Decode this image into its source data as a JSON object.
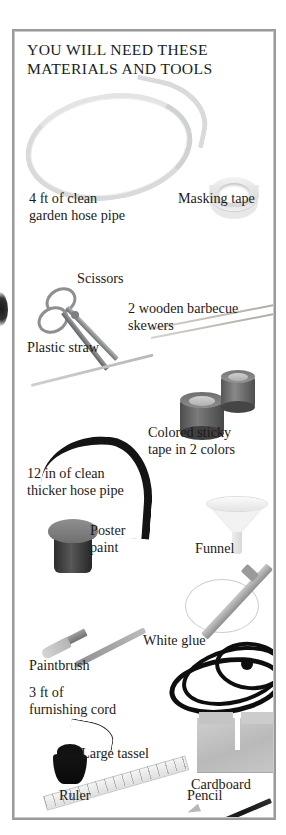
{
  "page": {
    "background_color": "#ffffff",
    "frame_border_color": "#9a9a9a"
  },
  "panel": {
    "title": "YOU WILL NEED THESE\nMATERIALS AND TOOLS"
  },
  "materials": [
    {
      "id": "garden-hose",
      "label": "4 ft of clean\ngarden hose pipe",
      "illustration": "coiled-light-gray-hose"
    },
    {
      "id": "masking-tape",
      "label": "Masking tape",
      "illustration": "tape-roll-ring"
    },
    {
      "id": "scissors",
      "label": "Scissors",
      "illustration": "scissors"
    },
    {
      "id": "skewers",
      "label": "2 wooden barbecue\nskewers",
      "illustration": "two-thin-rods"
    },
    {
      "id": "plastic-straw",
      "label": "Plastic straw",
      "illustration": "thin-straw"
    },
    {
      "id": "sticky-tape",
      "label": "Colored sticky\ntape in 2 colors",
      "illustration": "two-tape-cylinders"
    },
    {
      "id": "thicker-hose",
      "label": "12 in of clean\nthicker hose pipe",
      "illustration": "black-curved-hose"
    },
    {
      "id": "funnel",
      "label": "Funnel",
      "illustration": "white-funnel"
    },
    {
      "id": "poster-paint",
      "label": "Poster\npaint",
      "illustration": "paint-pot"
    },
    {
      "id": "white-glue",
      "label": "White glue",
      "illustration": "glue-tube-and-loop"
    },
    {
      "id": "paintbrush",
      "label": "Paintbrush",
      "illustration": "paintbrush"
    },
    {
      "id": "furnishing-cord",
      "label": "3 ft of\nfurnishing cord",
      "illustration": "black-coiled-cord"
    },
    {
      "id": "large-tassel",
      "label": "Large tassel",
      "illustration": "black-tassel"
    },
    {
      "id": "cardboard",
      "label": "Cardboard",
      "illustration": "gray-cardboard-sheet"
    },
    {
      "id": "ruler",
      "label": "Ruler",
      "illustration": "ruler"
    },
    {
      "id": "pencil",
      "label": "Pencil",
      "illustration": "pencil"
    }
  ]
}
